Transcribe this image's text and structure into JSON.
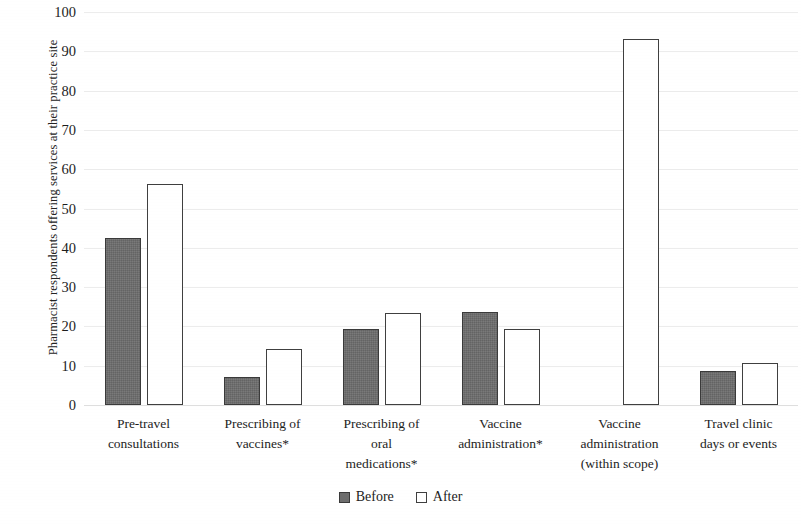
{
  "chart_data": {
    "type": "bar",
    "title": "",
    "xlabel": "",
    "ylabel": "Pharmacist respondents offering  services at their practice site",
    "ylim": [
      0,
      100
    ],
    "yticks": [
      0,
      10,
      20,
      30,
      40,
      50,
      60,
      70,
      80,
      90,
      100
    ],
    "ytick_labels": [
      "0",
      "10",
      "20",
      "30",
      "40",
      "50",
      "60",
      "70",
      "80",
      "90",
      "100"
    ],
    "grid": true,
    "grid_axis": "y",
    "legend_position": "bottom-center",
    "categories": [
      "Pre-travel consultations",
      "Prescribing of vaccines*",
      "Prescribing of oral medications*",
      "Vaccine administration*",
      "Vaccine administration (within scope)",
      "Travel clinic days or events"
    ],
    "category_lines": [
      [
        "Pre-travel",
        "consultations"
      ],
      [
        "Prescribing of",
        "vaccines*"
      ],
      [
        "Prescribing of",
        "oral",
        "medications*"
      ],
      [
        "Vaccine",
        "administration*"
      ],
      [
        "Vaccine",
        "administration",
        "(within scope)"
      ],
      [
        "Travel clinic",
        "days or events"
      ]
    ],
    "series": [
      {
        "name": "Before",
        "color": "#6d6d6d",
        "edge_color": "#3a3a3a",
        "values": [
          42.5,
          7.2,
          19.3,
          23.6,
          null,
          8.6
        ]
      },
      {
        "name": "After",
        "color": "#ffffff",
        "edge_color": "#3f3f3f",
        "values": [
          56.2,
          14.3,
          23.3,
          19.3,
          93.2,
          10.8
        ]
      }
    ]
  },
  "legend": {
    "items": [
      {
        "label": "Before",
        "style": "filled-gray"
      },
      {
        "label": "After",
        "style": "open-white"
      }
    ]
  }
}
